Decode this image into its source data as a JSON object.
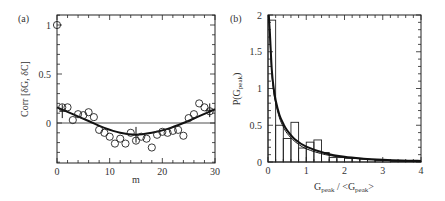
{
  "chart_data": [
    {
      "panel": "(a)",
      "type": "scatter",
      "xlabel": "m",
      "ylabel": "Corr [δG, δC]",
      "xlim": [
        0,
        30
      ],
      "ylim": [
        -0.4,
        1.1
      ],
      "xticks": [
        0,
        10,
        20,
        30
      ],
      "xtick_labels": [
        "0",
        "10",
        "20",
        "30"
      ],
      "yticks": [
        0,
        0.5,
        1
      ],
      "ytick_labels": [
        "0",
        "0.5",
        "1"
      ],
      "grid": false,
      "zero_line": true,
      "series": [
        {
          "name": "data",
          "marker": "open-circle",
          "x": [
            0,
            1,
            2,
            3,
            4,
            5,
            6,
            7,
            8,
            9,
            10,
            11,
            12,
            13,
            14,
            15,
            16,
            17,
            18,
            19,
            20,
            21,
            22,
            23,
            24,
            25,
            26,
            27,
            28,
            29
          ],
          "y": [
            1.0,
            0.16,
            0.16,
            0.03,
            0.09,
            0.08,
            0.11,
            0.06,
            -0.07,
            -0.1,
            -0.14,
            -0.21,
            -0.16,
            -0.21,
            -0.1,
            -0.18,
            -0.14,
            -0.16,
            -0.25,
            -0.12,
            -0.09,
            -0.1,
            -0.08,
            -0.07,
            -0.13,
            0.05,
            0.09,
            0.2,
            0.16,
            0.12
          ]
        },
        {
          "name": "fit",
          "style": "solid-thick",
          "x": [
            0,
            3,
            6,
            9,
            12,
            15,
            18,
            21,
            24,
            27,
            30
          ],
          "y": [
            0.16,
            0.09,
            0.02,
            -0.05,
            -0.1,
            -0.12,
            -0.1,
            -0.06,
            0.0,
            0.07,
            0.14
          ]
        }
      ],
      "error_bars": [
        {
          "x": 1,
          "y": 0.12,
          "err": 0.07
        },
        {
          "x": 15,
          "y": -0.12,
          "err": 0.08
        },
        {
          "x": 29,
          "y": 0.13,
          "err": 0.07
        }
      ]
    },
    {
      "panel": "(b)",
      "type": "bar",
      "subtype": "histogram-with-curves",
      "xlabel": "G_peak / <G_peak>",
      "ylabel": "P(G_peak)",
      "xlim": [
        0,
        4
      ],
      "ylim": [
        0,
        2
      ],
      "xticks": [
        0,
        1,
        2,
        3,
        4
      ],
      "xtick_labels": [
        "0",
        "1",
        "2",
        "3",
        "4"
      ],
      "yticks": [
        0,
        0.5,
        1,
        1.5,
        2
      ],
      "ytick_labels": [
        "0",
        "0.5",
        "1",
        "1.5",
        "2"
      ],
      "grid": false,
      "histogram": {
        "bin_width": 0.2,
        "bin_starts": [
          0.0,
          0.2,
          0.4,
          0.6,
          0.8,
          1.0,
          1.2,
          1.4,
          1.6,
          1.8,
          2.0,
          2.2,
          2.4,
          2.6,
          2.8,
          3.0,
          3.2,
          3.4,
          3.6,
          3.8
        ],
        "values": [
          1.93,
          0.5,
          0.32,
          0.54,
          0.19,
          0.27,
          0.3,
          0.13,
          0.06,
          0.06,
          0.05,
          0.05,
          0.04,
          0.03,
          0.02,
          0.02,
          0.01,
          0.01,
          0.01,
          0.01
        ]
      },
      "series": [
        {
          "name": "curve-1",
          "style": "solid-thick",
          "x": [
            0.02,
            0.05,
            0.1,
            0.15,
            0.2,
            0.3,
            0.4,
            0.5,
            0.7,
            1.0,
            1.5,
            2.0,
            2.5,
            3.0,
            3.5,
            4.0
          ],
          "y": [
            2.0,
            1.75,
            1.25,
            1.0,
            0.84,
            0.64,
            0.52,
            0.43,
            0.31,
            0.21,
            0.12,
            0.07,
            0.045,
            0.03,
            0.02,
            0.015
          ]
        },
        {
          "name": "curve-2",
          "style": "solid-thin",
          "x": [
            0.02,
            0.05,
            0.1,
            0.15,
            0.2,
            0.3,
            0.4,
            0.5,
            0.7,
            1.0,
            1.5,
            2.0,
            2.5,
            3.0,
            3.5,
            4.0
          ],
          "y": [
            2.0,
            1.7,
            1.2,
            0.95,
            0.8,
            0.6,
            0.48,
            0.39,
            0.28,
            0.18,
            0.1,
            0.06,
            0.04,
            0.025,
            0.015,
            0.01
          ]
        }
      ]
    }
  ]
}
